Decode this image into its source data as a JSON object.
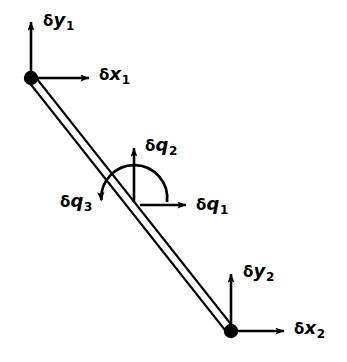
{
  "figure": {
    "type": "structural-beam-dof-diagram",
    "background_color": "#ffffff",
    "stroke_color": "#000000",
    "width": 347,
    "height": 362,
    "member": {
      "name": "inclined-beam-element",
      "style": "double-line",
      "node1": {
        "x": 31,
        "y": 78
      },
      "node2": {
        "x": 231,
        "y": 331
      }
    },
    "nodes": [
      {
        "id": "node-1",
        "label": "1",
        "x": 31,
        "y": 78,
        "radius": 7
      },
      {
        "id": "node-2",
        "label": "2",
        "x": 231,
        "y": 331,
        "radius": 7
      }
    ],
    "labels": {
      "dy1": {
        "delta": "δ",
        "var": "y",
        "sub": "1"
      },
      "dx1": {
        "delta": "δ",
        "var": "x",
        "sub": "1"
      },
      "dq1": {
        "delta": "δ",
        "var": "q",
        "sub": "1"
      },
      "dq2": {
        "delta": "δ",
        "var": "q",
        "sub": "2"
      },
      "dq3": {
        "delta": "δ",
        "var": "q",
        "sub": "3"
      },
      "dy2": {
        "delta": "δ",
        "var": "y",
        "sub": "2"
      },
      "dx2": {
        "delta": "δ",
        "var": "x",
        "sub": "2"
      }
    },
    "arrows": [
      {
        "name": "dy1-arrow",
        "kind": "straight",
        "direction": "up",
        "from": {
          "x": 31,
          "y": 78
        },
        "to": {
          "x": 31,
          "y": 16
        }
      },
      {
        "name": "dx1-arrow",
        "kind": "straight",
        "direction": "right",
        "from": {
          "x": 31,
          "y": 78
        },
        "to": {
          "x": 95,
          "y": 78
        }
      },
      {
        "name": "dq2-arrow",
        "kind": "straight",
        "direction": "up",
        "from": {
          "x": 134,
          "y": 202
        },
        "to": {
          "x": 134,
          "y": 142
        }
      },
      {
        "name": "dq1-arrow",
        "kind": "straight",
        "direction": "right",
        "from": {
          "x": 140,
          "y": 205
        },
        "to": {
          "x": 192,
          "y": 205
        }
      },
      {
        "name": "dq3-arrow",
        "kind": "curved",
        "direction": "counterclockwise",
        "center": {
          "x": 134,
          "y": 202
        },
        "radius": 33,
        "sweep": "right-over-top-to-left",
        "arrowhead": "down"
      },
      {
        "name": "dy2-arrow",
        "kind": "straight",
        "direction": "up",
        "from": {
          "x": 231,
          "y": 331
        },
        "to": {
          "x": 231,
          "y": 268
        }
      },
      {
        "name": "dx2-arrow",
        "kind": "straight",
        "direction": "right",
        "from": {
          "x": 231,
          "y": 331
        },
        "to": {
          "x": 290,
          "y": 331
        }
      }
    ]
  }
}
